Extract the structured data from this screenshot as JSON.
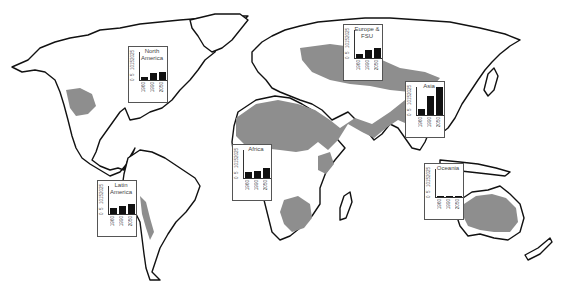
{
  "map": {
    "colors": {
      "land": "#ffffff",
      "coastline": "#111111",
      "highlighted_region": "#8e8e8e",
      "bars": "#111111"
    }
  },
  "chart_data": [
    {
      "type": "bar",
      "title": "North America",
      "categories": [
        "1960",
        "1990",
        "2050"
      ],
      "values": [
        3,
        6,
        7
      ],
      "ylim": [
        0,
        25
      ],
      "yticks": [
        "0",
        "5",
        "10",
        "15",
        "20",
        "25"
      ]
    },
    {
      "type": "bar",
      "title": "Europe & FSU",
      "categories": [
        "1960",
        "1990",
        "2050"
      ],
      "values": [
        4,
        7,
        9
      ],
      "ylim": [
        0,
        25
      ],
      "yticks": [
        "0",
        "5",
        "10",
        "15",
        "20",
        "25"
      ]
    },
    {
      "type": "bar",
      "title": "Asia",
      "categories": [
        "1960",
        "1990",
        "2050"
      ],
      "values": [
        5.5,
        17,
        25
      ],
      "ylim": [
        0,
        25
      ],
      "yticks": [
        "0",
        "5",
        "10",
        "15",
        "20",
        "25"
      ]
    },
    {
      "type": "bar",
      "title": "Africa",
      "categories": [
        "1960",
        "1990",
        "2050"
      ],
      "values": [
        5.5,
        6.5,
        8.5
      ],
      "ylim": [
        0,
        25
      ],
      "yticks": [
        "0",
        "5",
        "10",
        "15",
        "20",
        "25"
      ]
    },
    {
      "type": "bar",
      "title": "Latin America",
      "categories": [
        "1960",
        "1990",
        "2050"
      ],
      "values": [
        5.5,
        7,
        8.5
      ],
      "ylim": [
        0,
        25
      ],
      "yticks": [
        "0",
        "5",
        "10",
        "15",
        "20",
        "25"
      ]
    },
    {
      "type": "bar",
      "title": "Oceania",
      "categories": [
        "1960",
        "1990",
        "2050"
      ],
      "values": [
        0.5,
        0.5,
        0.5
      ],
      "ylim": [
        0,
        25
      ],
      "yticks": [
        "0",
        "5",
        "10",
        "15",
        "20",
        "25"
      ]
    }
  ],
  "insets": [
    {
      "id": "north-america",
      "title_lines": [
        "North",
        "America"
      ],
      "x": 128,
      "y": 46
    },
    {
      "id": "europe-fsu",
      "title_lines": [
        "Europe &",
        "FSU"
      ],
      "x": 343,
      "y": 24
    },
    {
      "id": "asia",
      "title_lines": [
        "Asia"
      ],
      "x": 405,
      "y": 81
    },
    {
      "id": "africa",
      "title_lines": [
        "Africa"
      ],
      "x": 232,
      "y": 144
    },
    {
      "id": "latin-america",
      "title_lines": [
        "Latin",
        "America"
      ],
      "x": 97,
      "y": 180
    },
    {
      "id": "oceania",
      "title_lines": [
        "Oceania"
      ],
      "x": 424,
      "y": 163
    }
  ]
}
